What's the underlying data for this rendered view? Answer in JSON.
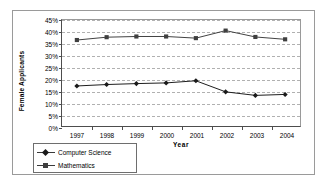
{
  "chart_data": {
    "type": "line",
    "title": "",
    "xlabel": "Year",
    "ylabel": "Female Applicants",
    "categories": [
      "1997",
      "1998",
      "1999",
      "2000",
      "2001",
      "2002",
      "2003",
      "2004"
    ],
    "series": [
      {
        "name": "Computer Science",
        "marker": "diamond",
        "color": "#1a1a1a",
        "values": [
          17.0,
          17.6,
          18.0,
          18.3,
          19.2,
          14.5,
          13.0,
          13.4
        ]
      },
      {
        "name": "Mathematics",
        "marker": "square",
        "color": "#3f3f3f",
        "values": [
          36.5,
          37.7,
          38.0,
          38.0,
          37.3,
          40.5,
          37.8,
          36.8
        ]
      }
    ],
    "ylim": [
      0,
      45
    ],
    "ytick_labels": [
      "0%",
      "5%",
      "10%",
      "15%",
      "20%",
      "25%",
      "30%",
      "35%",
      "40%",
      "45%"
    ],
    "ytick_values": [
      0,
      5,
      10,
      15,
      20,
      25,
      30,
      35,
      40,
      45
    ],
    "grid": true,
    "grid_axis": "y",
    "grid_style": "dashed",
    "legend_position": "bottom-left"
  },
  "colors": {
    "frame": "#9a9a9a",
    "axis": "#4d4d4d",
    "gridline": "#b0b0b0",
    "background": "#ffffff",
    "text": "#000000"
  }
}
